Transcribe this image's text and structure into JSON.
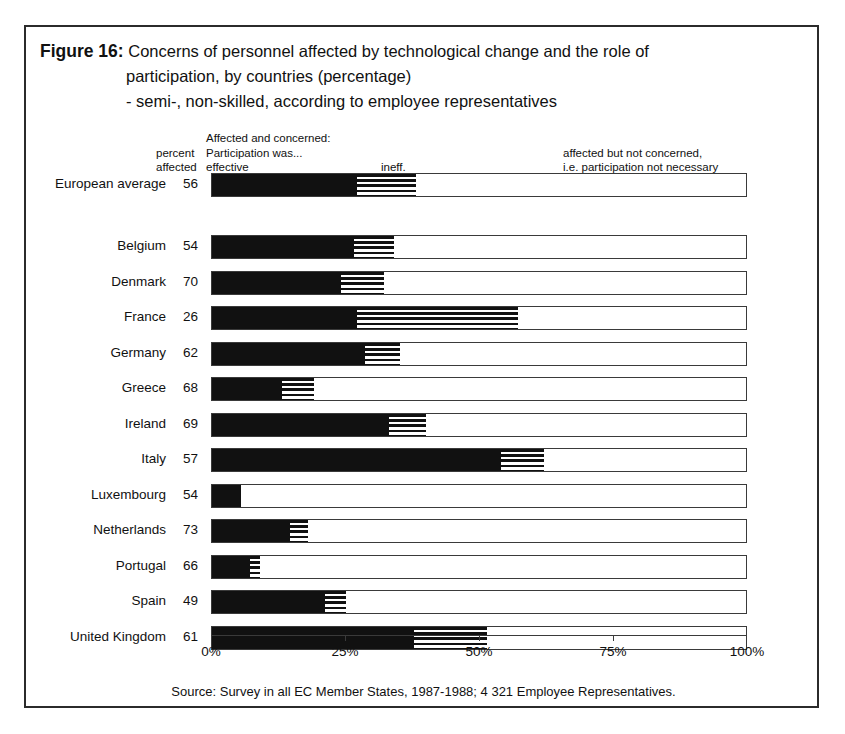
{
  "figure": {
    "label": "Figure 16:",
    "title_line1": "Concerns of personnel affected by technological change and the role of",
    "title_line2": "participation, by countries (percentage)",
    "title_line3": "- semi-, non-skilled, according to employee representatives",
    "source": "Source: Survey in all EC Member States, 1987-1988; 4 321 Employee Representatives."
  },
  "legend": {
    "percent": "percent",
    "affected": "affected",
    "concerned_line1": "Affected and concerned:",
    "concerned_line2": "Participation was...",
    "effective": "effective",
    "ineffective": "ineff.",
    "not_concerned_line1": "affected but not concerned,",
    "not_concerned_line2": "i.e. participation not necessary"
  },
  "colors": {
    "effective": "#111111",
    "ineffective": "#111111",
    "not_concerned": "#ffffff",
    "border": "#3a3a3a",
    "frame": "#2b2b2b"
  },
  "chart_data": {
    "type": "bar",
    "orientation": "horizontal",
    "stacked": true,
    "xlabel": "",
    "ylabel": "",
    "xlim": [
      0,
      100
    ],
    "xticks": [
      0,
      25,
      50,
      75,
      100
    ],
    "xticklabels": [
      "0%",
      "25%",
      "50%",
      "75%",
      "100%"
    ],
    "grid": false,
    "legend_position": "top",
    "series": [
      {
        "name": "effective",
        "label": "Affected and concerned: Participation was... effective"
      },
      {
        "name": "ineffective",
        "label": "ineff."
      },
      {
        "name": "not_concerned",
        "label": "affected but not concerned, i.e. participation not necessary"
      }
    ],
    "categories": [
      "European average",
      "Belgium",
      "Denmark",
      "France",
      "Germany",
      "Greece",
      "Ireland",
      "Italy",
      "Luxembourg",
      "Netherlands",
      "Portugal",
      "Spain",
      "United Kingdom"
    ],
    "percent_affected": [
      56,
      54,
      70,
      26,
      62,
      68,
      69,
      57,
      54,
      73,
      66,
      49,
      61
    ],
    "rows": [
      {
        "country": "European average",
        "percent_affected": 56,
        "effective": 27.0,
        "ineffective": 11.0,
        "not_concerned": 62.0,
        "separated": true
      },
      {
        "country": "Belgium",
        "percent_affected": 54,
        "effective": 26.5,
        "ineffective": 7.5,
        "not_concerned": 66.0
      },
      {
        "country": "Denmark",
        "percent_affected": 70,
        "effective": 24.0,
        "ineffective": 8.0,
        "not_concerned": 68.0
      },
      {
        "country": "France",
        "percent_affected": 26,
        "effective": 27.0,
        "ineffective": 30.0,
        "not_concerned": 43.0
      },
      {
        "country": "Germany",
        "percent_affected": 62,
        "effective": 28.5,
        "ineffective": 6.5,
        "not_concerned": 65.0
      },
      {
        "country": "Greece",
        "percent_affected": 68,
        "effective": 13.0,
        "ineffective": 6.0,
        "not_concerned": 81.0
      },
      {
        "country": "Ireland",
        "percent_affected": 69,
        "effective": 33.0,
        "ineffective": 7.0,
        "not_concerned": 60.0
      },
      {
        "country": "Italy",
        "percent_affected": 57,
        "effective": 54.0,
        "ineffective": 8.0,
        "not_concerned": 38.0
      },
      {
        "country": "Luxembourg",
        "percent_affected": 54,
        "effective": 5.5,
        "ineffective": 0.0,
        "not_concerned": 94.5
      },
      {
        "country": "Netherlands",
        "percent_affected": 73,
        "effective": 14.5,
        "ineffective": 3.5,
        "not_concerned": 82.0
      },
      {
        "country": "Portugal",
        "percent_affected": 66,
        "effective": 7.0,
        "ineffective": 2.0,
        "not_concerned": 91.0
      },
      {
        "country": "Spain",
        "percent_affected": 49,
        "effective": 21.0,
        "ineffective": 4.0,
        "not_concerned": 75.0
      },
      {
        "country": "United Kingdom",
        "percent_affected": 61,
        "effective": 37.7,
        "ineffective": 13.6,
        "not_concerned": 48.7
      }
    ]
  }
}
